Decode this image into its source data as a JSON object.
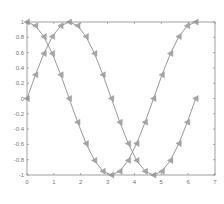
{
  "chart_data": {
    "type": "line",
    "title": "",
    "xlabel": "",
    "ylabel": "",
    "xlim": [
      0,
      7
    ],
    "ylim": [
      -1,
      1
    ],
    "grid": false,
    "legend": null,
    "x_ticks": [
      "0",
      "1",
      "2",
      "3",
      "4",
      "5",
      "6",
      "7"
    ],
    "y_ticks": [
      "-1",
      "-0.8",
      "-0.6",
      "-0.4",
      "-0.2",
      "0",
      "0.2",
      "0.4",
      "0.6",
      "0.8",
      "1"
    ],
    "marker": "triangle-left",
    "x": [
      0,
      0.314,
      0.628,
      0.942,
      1.257,
      1.571,
      1.885,
      2.199,
      2.513,
      2.827,
      3.142,
      3.456,
      3.77,
      4.084,
      4.398,
      4.712,
      5.027,
      5.341,
      5.655,
      5.969,
      6.283
    ],
    "series": [
      {
        "name": "sin",
        "color": "#9a9a9a",
        "values": [
          0,
          0.309,
          0.588,
          0.809,
          0.951,
          1,
          0.951,
          0.809,
          0.588,
          0.309,
          0,
          -0.309,
          -0.588,
          -0.809,
          -0.951,
          -1,
          -0.951,
          -0.809,
          -0.588,
          -0.309,
          0
        ]
      },
      {
        "name": "cos",
        "color": "#9a9a9a",
        "values": [
          1,
          0.951,
          0.809,
          0.588,
          0.309,
          0,
          -0.309,
          -0.588,
          -0.809,
          -0.951,
          -1,
          -0.951,
          -0.809,
          -0.588,
          -0.309,
          0,
          0.309,
          0.588,
          0.809,
          0.951,
          1
        ]
      }
    ]
  },
  "style": {
    "axis_color": "#888888",
    "line_color": "#9a9a9a",
    "marker_color": "#a6a6a6"
  }
}
